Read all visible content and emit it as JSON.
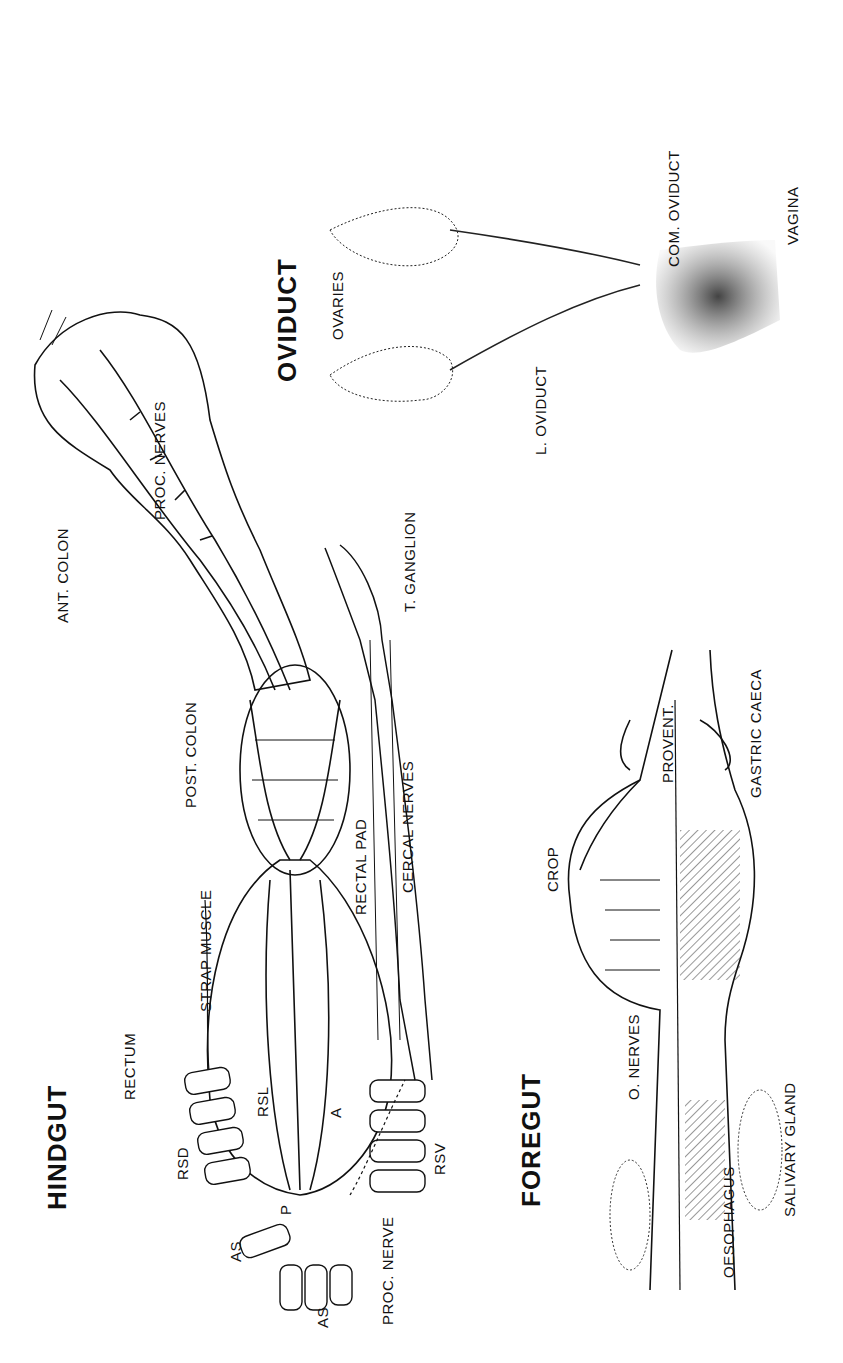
{
  "figure": {
    "orientation": "rotated 90deg counterclockwise",
    "panels": [
      {
        "id": "hindgut",
        "title": "HINDGUT",
        "labels": [
          "RECTUM",
          "RSD",
          "RSL",
          "AS",
          "AS",
          "P",
          "A",
          "RSV",
          "PROC. NERVE",
          "STRAP MUSCLE",
          "POST. COLON",
          "RECTAL PAD",
          "CERCAL NERVES",
          "ANT. COLON",
          "PROC. NERVES",
          "T. GANGLION"
        ]
      },
      {
        "id": "foregut",
        "title": "FOREGUT",
        "labels": [
          "O. NERVES",
          "OESOPHAGUS",
          "SALIVARY GLAND",
          "CROP",
          "PROVENT.",
          "GASTRIC CAECA"
        ]
      },
      {
        "id": "oviduct",
        "title": "OVIDUCT",
        "labels": [
          "OVARIES",
          "L. OVIDUCT",
          "COM. OVIDUCT",
          "VAGINA"
        ]
      }
    ]
  },
  "hindgut": {
    "title": "HINDGUT",
    "rectum": "RECTUM",
    "rsd": "RSD",
    "rsl": "RSL",
    "as1": "AS",
    "as2": "AS",
    "p": "P",
    "a": "A",
    "rsv": "RSV",
    "proc_nerve": "PROC. NERVE",
    "strap_muscle": "STRAP MUSCLE",
    "post_colon": "POST. COLON",
    "rectal_pad": "RECTAL PAD",
    "cercal_nerves": "CERCAL NERVES",
    "ant_colon": "ANT. COLON",
    "proc_nerves": "PROC. NERVES",
    "t_ganglion": "T. GANGLION"
  },
  "foregut": {
    "title": "FOREGUT",
    "o_nerves": "O. NERVES",
    "oesophagus": "OESOPHAGUS",
    "salivary_gland": "SALIVARY GLAND",
    "crop": "CROP",
    "provent": "PROVENT.",
    "gastric_caeca": "GASTRIC CAECA"
  },
  "oviduct": {
    "title": "OVIDUCT",
    "ovaries": "OVARIES",
    "l_oviduct": "L. OVIDUCT",
    "com_oviduct": "COM. OVIDUCT",
    "vagina": "VAGINA"
  }
}
